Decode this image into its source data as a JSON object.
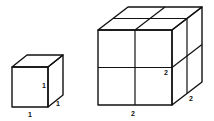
{
  "diagram": {
    "small_cube": {
      "label_width": "1",
      "label_height": "1",
      "label_depth": "1"
    },
    "large_cube": {
      "label_width": "2",
      "label_height": "2",
      "label_depth": "2",
      "subdivisions": 2
    },
    "colors": {
      "stroke": "#111111",
      "background": "#ffffff"
    }
  }
}
